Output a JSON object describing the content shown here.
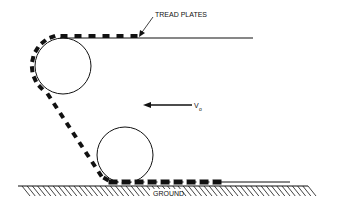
{
  "diagram": {
    "labels": {
      "tread_plates": "TREAD PLATES",
      "velocity": "V",
      "velocity_subscript": "o",
      "ground": "GROUND"
    },
    "colors": {
      "ink": "#111111",
      "background": "#ffffff"
    }
  }
}
